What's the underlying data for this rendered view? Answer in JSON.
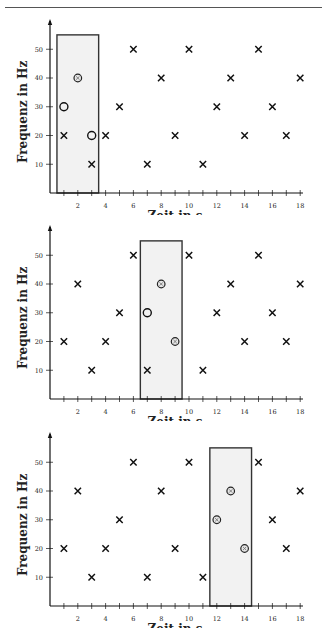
{
  "header": {
    "text": ""
  },
  "chart_data": [
    {
      "type": "scatter",
      "title": "",
      "xlabel": "Zeit in s",
      "ylabel": "Frequenz in Hz",
      "xlim": [
        0,
        18
      ],
      "ylim": [
        0,
        55
      ],
      "xticks": [
        1,
        2,
        3,
        4,
        5,
        6,
        7,
        8,
        9,
        10,
        11,
        12,
        13,
        14,
        15,
        16,
        17,
        18
      ],
      "xtick_labels": [
        "2",
        "4",
        "6",
        "8",
        "10",
        "12",
        "14",
        "16",
        "18"
      ],
      "yticks": [
        10,
        20,
        30,
        40,
        50
      ],
      "ytick_labels": [
        "10",
        "20",
        "30",
        "40",
        "50"
      ],
      "grid": false,
      "window": {
        "x_start": 0.5,
        "x_end": 3.5,
        "y_top": 55,
        "fill": "#f2f2f2"
      },
      "series": [
        {
          "name": "reference",
          "marker": "x",
          "points": [
            [
              1,
              20
            ],
            [
              3,
              10
            ],
            [
              4,
              20
            ],
            [
              5,
              30
            ],
            [
              6,
              50
            ],
            [
              7,
              10
            ],
            [
              8,
              40
            ],
            [
              9,
              20
            ],
            [
              10,
              50
            ],
            [
              11,
              10
            ],
            [
              12,
              30
            ],
            [
              13,
              40
            ],
            [
              14,
              20
            ],
            [
              15,
              50
            ],
            [
              16,
              30
            ],
            [
              17,
              20
            ],
            [
              18,
              40
            ]
          ]
        },
        {
          "name": "query-unmatched",
          "marker": "o",
          "points": [
            [
              1,
              30
            ],
            [
              3,
              20
            ]
          ]
        },
        {
          "name": "query-matched",
          "marker": "circled-x",
          "points": [
            [
              2,
              40
            ]
          ]
        }
      ]
    },
    {
      "type": "scatter",
      "title": "",
      "xlabel": "Zeit in s",
      "ylabel": "Frequenz in Hz",
      "xlim": [
        0,
        18
      ],
      "ylim": [
        0,
        55
      ],
      "xticks": [
        1,
        2,
        3,
        4,
        5,
        6,
        7,
        8,
        9,
        10,
        11,
        12,
        13,
        14,
        15,
        16,
        17,
        18
      ],
      "xtick_labels": [
        "2",
        "4",
        "6",
        "8",
        "10",
        "12",
        "14",
        "16",
        "18"
      ],
      "yticks": [
        10,
        20,
        30,
        40,
        50
      ],
      "ytick_labels": [
        "10",
        "20",
        "30",
        "40",
        "50"
      ],
      "grid": false,
      "window": {
        "x_start": 6.5,
        "x_end": 9.5,
        "y_top": 55,
        "fill": "#f2f2f2"
      },
      "series": [
        {
          "name": "reference",
          "marker": "x",
          "points": [
            [
              1,
              20
            ],
            [
              2,
              40
            ],
            [
              3,
              10
            ],
            [
              4,
              20
            ],
            [
              5,
              30
            ],
            [
              6,
              50
            ],
            [
              7,
              10
            ],
            [
              10,
              50
            ],
            [
              11,
              10
            ],
            [
              12,
              30
            ],
            [
              13,
              40
            ],
            [
              14,
              20
            ],
            [
              15,
              50
            ],
            [
              16,
              30
            ],
            [
              17,
              20
            ],
            [
              18,
              40
            ]
          ]
        },
        {
          "name": "query-unmatched",
          "marker": "o",
          "points": [
            [
              7,
              30
            ]
          ]
        },
        {
          "name": "query-matched",
          "marker": "circled-x",
          "points": [
            [
              8,
              40
            ],
            [
              9,
              20
            ]
          ]
        }
      ]
    },
    {
      "type": "scatter",
      "title": "",
      "xlabel": "Zeit in s",
      "ylabel": "Frequenz in Hz",
      "xlim": [
        0,
        18
      ],
      "ylim": [
        0,
        55
      ],
      "xticks": [
        1,
        2,
        3,
        4,
        5,
        6,
        7,
        8,
        9,
        10,
        11,
        12,
        13,
        14,
        15,
        16,
        17,
        18
      ],
      "xtick_labels": [
        "2",
        "4",
        "6",
        "8",
        "10",
        "12",
        "14",
        "16",
        "18"
      ],
      "yticks": [
        10,
        20,
        30,
        40,
        50
      ],
      "ytick_labels": [
        "10",
        "20",
        "30",
        "40",
        "50"
      ],
      "grid": false,
      "window": {
        "x_start": 11.5,
        "x_end": 14.5,
        "y_top": 55,
        "fill": "#f2f2f2"
      },
      "series": [
        {
          "name": "reference",
          "marker": "x",
          "points": [
            [
              1,
              20
            ],
            [
              2,
              40
            ],
            [
              3,
              10
            ],
            [
              4,
              20
            ],
            [
              5,
              30
            ],
            [
              6,
              50
            ],
            [
              7,
              10
            ],
            [
              8,
              40
            ],
            [
              9,
              20
            ],
            [
              10,
              50
            ],
            [
              11,
              10
            ],
            [
              15,
              50
            ],
            [
              16,
              30
            ],
            [
              17,
              20
            ],
            [
              18,
              40
            ]
          ]
        },
        {
          "name": "query-unmatched",
          "marker": "o",
          "points": []
        },
        {
          "name": "query-matched",
          "marker": "circled-x",
          "points": [
            [
              12,
              30
            ],
            [
              13,
              40
            ],
            [
              14,
              20
            ]
          ]
        }
      ]
    }
  ],
  "layout": {
    "panels_top": [
      0,
      206,
      413
    ]
  }
}
